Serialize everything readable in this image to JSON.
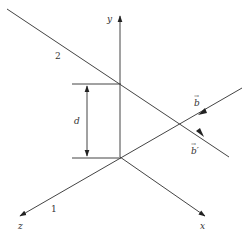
{
  "diagram": {
    "type": "3d-axes-skew-lines",
    "axes": {
      "x_label": "x",
      "y_label": "y",
      "z_label": "z"
    },
    "lines": [
      {
        "id": "1",
        "label": "1",
        "direction_label": "b′"
      },
      {
        "id": "2",
        "label": "2",
        "direction_label": "b"
      }
    ],
    "distance_label": "d",
    "vector_b": "b",
    "vector_b_prime": "b′",
    "vector_arrow_glyph": "→"
  },
  "colors": {
    "stroke": "#444444",
    "text": "#333333",
    "background": "#ffffff"
  }
}
